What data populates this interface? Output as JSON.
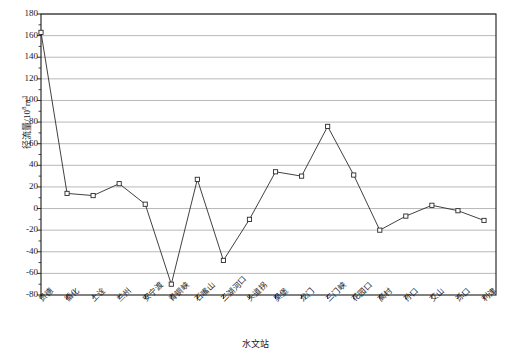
{
  "chart_data": {
    "type": "line",
    "title": "",
    "xlabel": "水文站",
    "ylabel": "径流量/10",
    "ylabel_exponent": "8",
    "ylabel_unit": "m",
    "ylabel_unit_exponent": "3",
    "ylabel_full": "径流量/10⁸m³",
    "categories": [
      "贵德",
      "循化",
      "上诠",
      "兰州",
      "安宁渡",
      "青铜峡",
      "石嘴山",
      "三湖河口",
      "头道拐",
      "吴堡",
      "龙门",
      "三门峡",
      "花园口",
      "高村",
      "孙口",
      "艾山",
      "泺口",
      "利津"
    ],
    "values": [
      163,
      14,
      12,
      23,
      4,
      -70,
      27,
      -48,
      -10,
      34,
      30,
      76,
      31,
      -20,
      -7,
      3,
      -2,
      -11
    ],
    "ylim": [
      -80,
      180
    ],
    "ytick_step": 20,
    "yticks": [
      -80,
      -60,
      -40,
      -20,
      0,
      20,
      40,
      60,
      80,
      100,
      120,
      140,
      160,
      180
    ],
    "grid": true,
    "grid_axis": "y",
    "legend": "none",
    "marker": "square-open",
    "line_color": "#2b2b2b",
    "grid_color": "#9a9a9a",
    "axis_color": "#1a1a1a",
    "marker_fill": "#ffffff"
  }
}
